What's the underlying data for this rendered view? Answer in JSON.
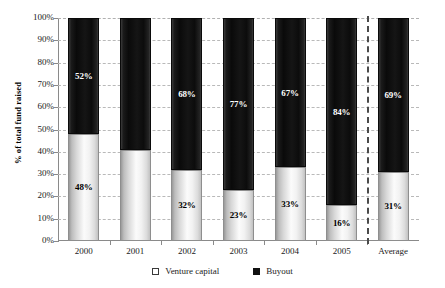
{
  "chart_data": {
    "type": "bar",
    "stacked": true,
    "title": "",
    "xlabel": "",
    "ylabel": "% of total fund raised",
    "ylim": [
      0,
      100
    ],
    "ytick_labels": [
      "100%",
      "90%",
      "80%",
      "70%",
      "60%",
      "50%",
      "40%",
      "30%",
      "20%",
      "10%",
      "0%"
    ],
    "ytick_values": [
      100,
      90,
      80,
      70,
      60,
      50,
      40,
      30,
      20,
      10,
      0
    ],
    "grid": "horizontal-dashed",
    "legend_position": "bottom-center",
    "categories": [
      "2000",
      "2001",
      "2002",
      "2003",
      "2004",
      "2005",
      "Average"
    ],
    "series": [
      {
        "name": "Venture capital",
        "color": "#f2f2f2",
        "values": [
          48,
          41,
          32,
          23,
          33,
          16,
          31
        ],
        "labels": [
          "48%",
          "",
          "32%",
          "23%",
          "33%",
          "16%",
          "31%"
        ]
      },
      {
        "name": "Buyout",
        "color": "#111111",
        "values": [
          52,
          59,
          68,
          77,
          67,
          84,
          69
        ],
        "labels": [
          "52%",
          "",
          "68%",
          "77%",
          "67%",
          "84%",
          "69%"
        ]
      }
    ],
    "annotations": [
      {
        "kind": "vertical-dashed-separator",
        "after_category": "2005"
      }
    ]
  },
  "legend": {
    "items": [
      {
        "label": "Venture capital",
        "swatch": "open-square-swatch"
      },
      {
        "label": "Buyout",
        "swatch": "filled-square-swatch"
      }
    ]
  }
}
